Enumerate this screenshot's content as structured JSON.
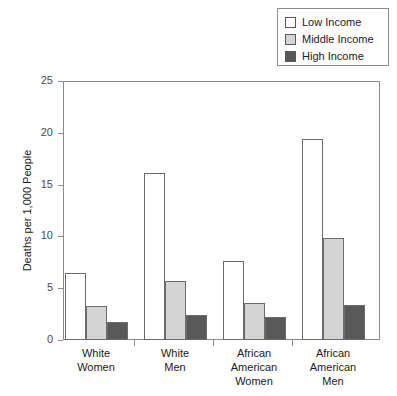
{
  "chart_data": {
    "type": "bar",
    "title": "",
    "subtitle": "",
    "xlabel": "",
    "ylabel": "Deaths per 1,000 People",
    "ylim": [
      0,
      25
    ],
    "yticks": [
      0,
      5,
      10,
      15,
      20,
      25
    ],
    "grid": false,
    "legend_position": "top-right",
    "categories": [
      "White\nWomen",
      "White\nMen",
      "African\nAmerican\nWomen",
      "African\nAmerican\nMen"
    ],
    "category_lines": [
      [
        "White",
        "Women"
      ],
      [
        "White",
        "Men"
      ],
      [
        "African",
        "American",
        "Women"
      ],
      [
        "African",
        "American",
        "Men"
      ]
    ],
    "series": [
      {
        "name": "Low Income",
        "color": "#ffffff",
        "values": [
          6.5,
          16.1,
          7.6,
          19.4
        ]
      },
      {
        "name": "Middle Income",
        "color": "#d4d4d4",
        "values": [
          3.3,
          5.7,
          3.6,
          9.8
        ]
      },
      {
        "name": "High Income",
        "color": "#595959",
        "values": [
          1.7,
          2.4,
          2.2,
          3.4
        ]
      }
    ]
  },
  "legend": {
    "items": [
      {
        "label": "Low Income",
        "color": "#ffffff"
      },
      {
        "label": "Middle Income",
        "color": "#d4d4d4"
      },
      {
        "label": "High Income",
        "color": "#595959"
      }
    ]
  },
  "axes": {
    "y_title": "Deaths per 1,000 People",
    "y_tick_labels": [
      "25",
      "20",
      "15",
      "10",
      "5",
      "0"
    ],
    "x_tick_labels": [
      "White Women",
      "White Men",
      "African American Women",
      "African American Men"
    ]
  }
}
